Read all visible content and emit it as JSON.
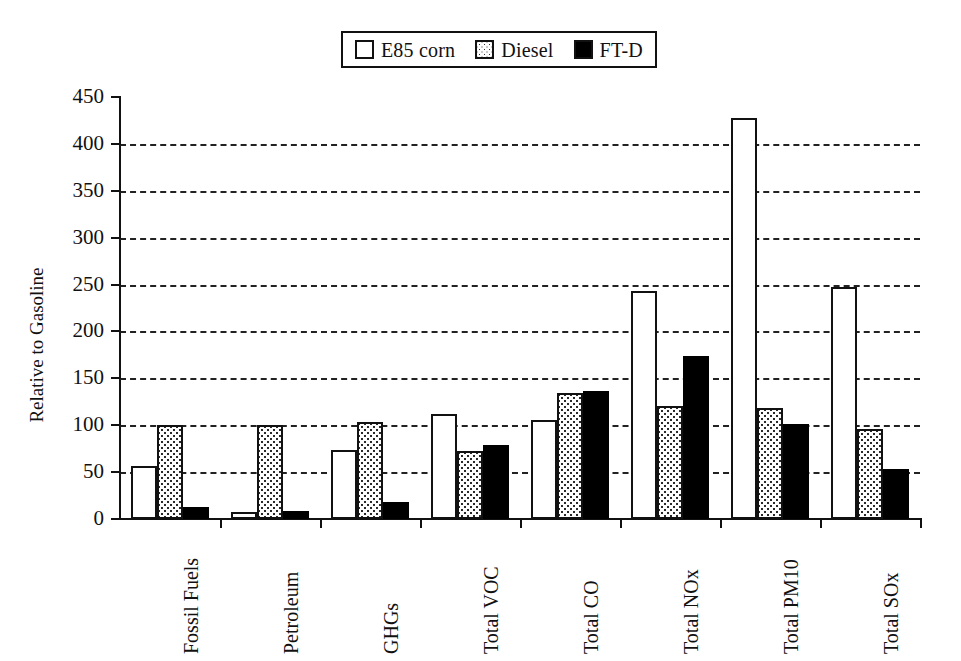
{
  "legend": {
    "position": "top-center",
    "entries": [
      {
        "label": "E85 corn",
        "style": "outline",
        "swatch_name": "legend-swatch-e85-corn"
      },
      {
        "label": "Diesel",
        "style": "dotted",
        "swatch_name": "legend-swatch-diesel"
      },
      {
        "label": "FT-D",
        "style": "solid",
        "swatch_name": "legend-swatch-ft-d"
      }
    ]
  },
  "axes": {
    "ylabel": "Relative to Gasoline",
    "xlabel": "",
    "yticks": [
      0,
      50,
      100,
      150,
      200,
      250,
      300,
      350,
      400,
      450
    ],
    "ylim": [
      0,
      450
    ],
    "grid": "horizontal-dashed"
  },
  "colors": {
    "e85_corn": "#ffffff",
    "diesel": "#fefefe",
    "ft_d": "#000000",
    "axis": "#111111",
    "gridline": "#222222",
    "background": "#ffffff"
  },
  "chart_data": {
    "type": "bar",
    "title": "",
    "xlabel": "",
    "ylabel": "Relative to Gasoline",
    "ylim": [
      0,
      450
    ],
    "yticks": [
      0,
      50,
      100,
      150,
      200,
      250,
      300,
      350,
      400,
      450
    ],
    "grid": true,
    "legend_position": "top-center",
    "categories": [
      "Fossil Fuels",
      "Petroleum",
      "GHGs",
      "Total VOC",
      "Total CO",
      "Total NOx",
      "Total PM10",
      "Total SOx"
    ],
    "series": [
      {
        "name": "E85 corn",
        "values": [
          57,
          7,
          74,
          112,
          106,
          243,
          428,
          247
        ]
      },
      {
        "name": "Diesel",
        "values": [
          100,
          100,
          103,
          72,
          134,
          120,
          118,
          96
        ]
      },
      {
        "name": "FT-D",
        "values": [
          13,
          9,
          18,
          79,
          136,
          174,
          101,
          53
        ]
      }
    ]
  }
}
